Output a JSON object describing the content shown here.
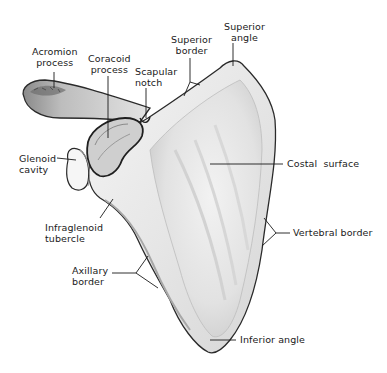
{
  "figure": {
    "colors": {
      "background": "#ffffff",
      "bone_fill": "#eeeeee",
      "bone_shade": "#c8c8c8",
      "outline": "#2a2a2a",
      "leader_line": "#1a1a1a",
      "label_text": "#1a1a1a"
    }
  },
  "labels": {
    "acromion_process": {
      "line1": "Acromion",
      "line2": "process"
    },
    "coracoid_process": {
      "line1": "Coracoid",
      "line2": "process"
    },
    "scapular_notch": {
      "line1": "Scapular",
      "line2": "notch"
    },
    "superior_border": {
      "line1": "Superior",
      "line2": "border"
    },
    "superior_angle": {
      "line1": "Superior",
      "line2": "angle"
    },
    "glenoid_cavity": {
      "line1": "Glenoid",
      "line2": "cavity"
    },
    "costal_surface": {
      "line1": "Costal  surface"
    },
    "infraglenoid_tubercle": {
      "line1": "Infraglenoid",
      "line2": "tubercle"
    },
    "vertebral_border": {
      "line1": "Vertebral border"
    },
    "axillary_border": {
      "line1": "Axillary",
      "line2": "border"
    },
    "inferior_angle": {
      "line1": "Inferior angle"
    }
  }
}
